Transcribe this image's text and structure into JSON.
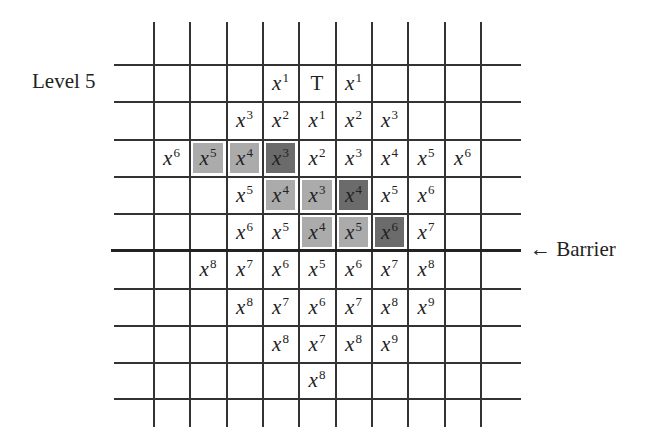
{
  "labels": {
    "level": "Level 5",
    "barrier": "← Barrier"
  },
  "colors": {
    "light_shade": "#ababab",
    "dark_shade": "#6b6b6b",
    "grid": "#333333"
  },
  "grid": {
    "col_x": [
      117,
      153,
      189,
      226,
      262,
      298,
      335,
      371,
      407,
      444,
      480
    ],
    "row_y": [
      22,
      64,
      101,
      139,
      176,
      213,
      250,
      288,
      325,
      362,
      398
    ],
    "barrier_after_row": 5
  },
  "cells": [
    {
      "row": 1,
      "col": 4,
      "base": "x",
      "exp": "1",
      "shade": ""
    },
    {
      "row": 1,
      "col": 5,
      "base": "T",
      "exp": "",
      "shade": ""
    },
    {
      "row": 1,
      "col": 6,
      "base": "x",
      "exp": "1",
      "shade": ""
    },
    {
      "row": 2,
      "col": 3,
      "base": "x",
      "exp": "3",
      "shade": ""
    },
    {
      "row": 2,
      "col": 4,
      "base": "x",
      "exp": "2",
      "shade": ""
    },
    {
      "row": 2,
      "col": 5,
      "base": "x",
      "exp": "1",
      "shade": ""
    },
    {
      "row": 2,
      "col": 6,
      "base": "x",
      "exp": "2",
      "shade": ""
    },
    {
      "row": 2,
      "col": 7,
      "base": "x",
      "exp": "3",
      "shade": ""
    },
    {
      "row": 3,
      "col": 1,
      "base": "x",
      "exp": "6",
      "shade": ""
    },
    {
      "row": 3,
      "col": 2,
      "base": "x",
      "exp": "5",
      "shade": "light"
    },
    {
      "row": 3,
      "col": 3,
      "base": "x",
      "exp": "4",
      "shade": "light"
    },
    {
      "row": 3,
      "col": 4,
      "base": "x",
      "exp": "3",
      "shade": "dark"
    },
    {
      "row": 3,
      "col": 5,
      "base": "x",
      "exp": "2",
      "shade": ""
    },
    {
      "row": 3,
      "col": 6,
      "base": "x",
      "exp": "3",
      "shade": ""
    },
    {
      "row": 3,
      "col": 7,
      "base": "x",
      "exp": "4",
      "shade": ""
    },
    {
      "row": 3,
      "col": 8,
      "base": "x",
      "exp": "5",
      "shade": ""
    },
    {
      "row": 3,
      "col": 9,
      "base": "x",
      "exp": "6",
      "shade": ""
    },
    {
      "row": 4,
      "col": 3,
      "base": "x",
      "exp": "5",
      "shade": ""
    },
    {
      "row": 4,
      "col": 4,
      "base": "x",
      "exp": "4",
      "shade": "light"
    },
    {
      "row": 4,
      "col": 5,
      "base": "x",
      "exp": "3",
      "shade": "light"
    },
    {
      "row": 4,
      "col": 6,
      "base": "x",
      "exp": "4",
      "shade": "dark"
    },
    {
      "row": 4,
      "col": 7,
      "base": "x",
      "exp": "5",
      "shade": ""
    },
    {
      "row": 4,
      "col": 8,
      "base": "x",
      "exp": "6",
      "shade": ""
    },
    {
      "row": 5,
      "col": 3,
      "base": "x",
      "exp": "6",
      "shade": ""
    },
    {
      "row": 5,
      "col": 4,
      "base": "x",
      "exp": "5",
      "shade": ""
    },
    {
      "row": 5,
      "col": 5,
      "base": "x",
      "exp": "4",
      "shade": "light"
    },
    {
      "row": 5,
      "col": 6,
      "base": "x",
      "exp": "5",
      "shade": "light"
    },
    {
      "row": 5,
      "col": 7,
      "base": "x",
      "exp": "6",
      "shade": "dark"
    },
    {
      "row": 5,
      "col": 8,
      "base": "x",
      "exp": "7",
      "shade": ""
    },
    {
      "row": 6,
      "col": 2,
      "base": "x",
      "exp": "8",
      "shade": ""
    },
    {
      "row": 6,
      "col": 3,
      "base": "x",
      "exp": "7",
      "shade": ""
    },
    {
      "row": 6,
      "col": 4,
      "base": "x",
      "exp": "6",
      "shade": ""
    },
    {
      "row": 6,
      "col": 5,
      "base": "x",
      "exp": "5",
      "shade": ""
    },
    {
      "row": 6,
      "col": 6,
      "base": "x",
      "exp": "6",
      "shade": ""
    },
    {
      "row": 6,
      "col": 7,
      "base": "x",
      "exp": "7",
      "shade": ""
    },
    {
      "row": 6,
      "col": 8,
      "base": "x",
      "exp": "8",
      "shade": ""
    },
    {
      "row": 7,
      "col": 3,
      "base": "x",
      "exp": "8",
      "shade": ""
    },
    {
      "row": 7,
      "col": 4,
      "base": "x",
      "exp": "7",
      "shade": ""
    },
    {
      "row": 7,
      "col": 5,
      "base": "x",
      "exp": "6",
      "shade": ""
    },
    {
      "row": 7,
      "col": 6,
      "base": "x",
      "exp": "7",
      "shade": ""
    },
    {
      "row": 7,
      "col": 7,
      "base": "x",
      "exp": "8",
      "shade": ""
    },
    {
      "row": 7,
      "col": 8,
      "base": "x",
      "exp": "9",
      "shade": ""
    },
    {
      "row": 8,
      "col": 4,
      "base": "x",
      "exp": "8",
      "shade": ""
    },
    {
      "row": 8,
      "col": 5,
      "base": "x",
      "exp": "7",
      "shade": ""
    },
    {
      "row": 8,
      "col": 6,
      "base": "x",
      "exp": "8",
      "shade": ""
    },
    {
      "row": 8,
      "col": 7,
      "base": "x",
      "exp": "9",
      "shade": ""
    },
    {
      "row": 9,
      "col": 5,
      "base": "x",
      "exp": "8",
      "shade": ""
    }
  ]
}
